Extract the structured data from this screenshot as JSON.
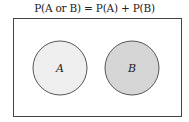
{
  "diagram": {
    "title": "P(A or B) = P(A) + P(B)",
    "universe": {
      "x": 13,
      "y": 18,
      "width": 168,
      "height": 98,
      "stroke": "#444444",
      "fill": "#ffffff"
    },
    "sets": [
      {
        "label": "A",
        "cx": 60,
        "cy": 68,
        "r": 27,
        "fill": "#efefef",
        "stroke": "#555555"
      },
      {
        "label": "B",
        "cx": 132,
        "cy": 68,
        "r": 27,
        "fill": "#d6d6d6",
        "stroke": "#555555"
      }
    ]
  }
}
